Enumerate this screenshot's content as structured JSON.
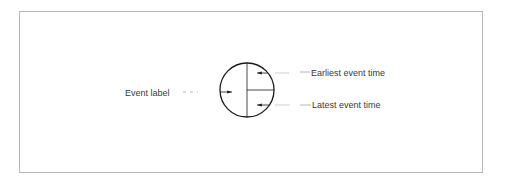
{
  "diagram": {
    "node": {
      "shape": "circle",
      "divisions": "left half / right upper quadrant / right lower quadrant"
    },
    "labels": {
      "event_label": "Event label",
      "earliest": "Earliest event time",
      "latest": "Latest event time"
    },
    "colors": {
      "line": "#1a1a1a",
      "text": "#3a3a3a",
      "frame": "#b8b8b8"
    }
  }
}
